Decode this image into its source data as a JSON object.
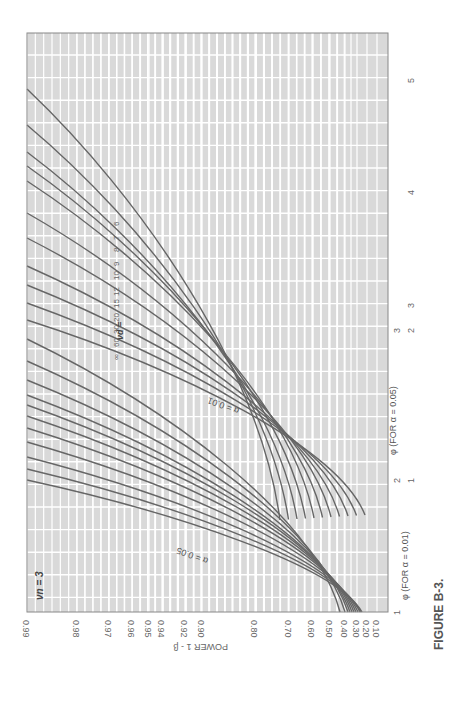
{
  "figure": {
    "caption": "FIGURE B-3.",
    "nu_n_label": "νn = 3",
    "nu_d_label": "νd =",
    "alpha_labels": {
      "a05": "α = 0.05",
      "a01": "α = 0.01"
    }
  },
  "axes": {
    "power_label": "POWER 1 - β",
    "phi_01_label": "φ (FOR α = 0.01)",
    "phi_05_label": "φ (FOR α = 0.05)",
    "power_ticks": [
      {
        "label": "0.99",
        "x": 27
      },
      {
        "label": "0.98",
        "x": 77
      },
      {
        "label": "0.97",
        "x": 109
      },
      {
        "label": "0.96",
        "x": 132
      },
      {
        "label": "0.95",
        "x": 149
      },
      {
        "label": "0.94",
        "x": 162
      },
      {
        "label": "0.92",
        "x": 185
      },
      {
        "label": "0.90",
        "x": 202
      },
      {
        "label": "0.80",
        "x": 255
      },
      {
        "label": "0.70",
        "x": 289
      },
      {
        "label": "0.60",
        "x": 312
      },
      {
        "label": "0.50",
        "x": 330
      },
      {
        "label": "0.40",
        "x": 345
      },
      {
        "label": "0.30",
        "x": 357
      },
      {
        "label": "0.20",
        "x": 367
      },
      {
        "label": "0.10",
        "x": 377
      }
    ],
    "phi_01_ticks": [
      {
        "label": "1",
        "y": 612
      },
      {
        "label": "2",
        "y": 480
      },
      {
        "label": "3",
        "y": 330
      }
    ],
    "phi_05_ticks": [
      {
        "label": "1",
        "y": 480
      },
      {
        "label": "2",
        "y": 330
      },
      {
        "label": "3",
        "y": 305
      },
      {
        "label": "4",
        "y": 192
      },
      {
        "label": "5",
        "y": 80
      }
    ]
  },
  "chart_data": {
    "type": "line",
    "title": "FIGURE B-3.",
    "subtitle": "Power curves for analysis of variance, νn = 3",
    "xlabel": "φ",
    "ylabel": "POWER 1 - β",
    "x_scale_alpha_0.05": [
      1,
      2,
      3,
      4,
      5
    ],
    "x_scale_alpha_0.01": [
      1,
      2,
      3
    ],
    "y_ticks": [
      0.1,
      0.2,
      0.3,
      0.4,
      0.5,
      0.6,
      0.7,
      0.8,
      0.9,
      0.92,
      0.94,
      0.95,
      0.96,
      0.97,
      0.98,
      0.99
    ],
    "ylim": [
      0.1,
      0.99
    ],
    "grid": true,
    "series_groups": [
      {
        "alpha": "0.05",
        "nu_d": [
          "6",
          "7",
          "8",
          "9",
          "10",
          "12",
          "15",
          "20",
          "30",
          "60",
          "∞"
        ]
      },
      {
        "alpha": "0.01",
        "nu_d": [
          "6",
          "7",
          "8",
          "9",
          "10",
          "12",
          "15",
          "20",
          "30",
          "60",
          "∞"
        ]
      }
    ]
  }
}
